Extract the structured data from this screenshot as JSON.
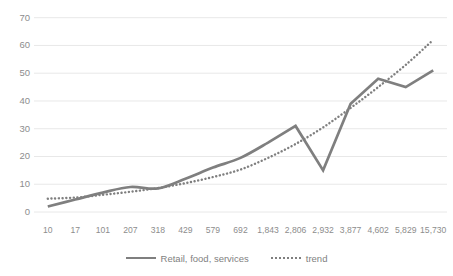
{
  "chart_data": {
    "type": "line",
    "title": "",
    "xlabel": "",
    "ylabel": "",
    "ylim": [
      0,
      70
    ],
    "ytick_step": 10,
    "grid": true,
    "legend_position": "bottom",
    "categories": [
      "10",
      "17",
      "101",
      "207",
      "318",
      "429",
      "579",
      "692",
      "1,843",
      "2,806",
      "2,932",
      "3,877",
      "4,602",
      "5,829",
      "15,730"
    ],
    "ticks": {
      "y": [
        "0",
        "10",
        "20",
        "30",
        "40",
        "50",
        "60",
        "70"
      ]
    },
    "series": [
      {
        "name": "Retail, food, services",
        "style": "solid",
        "color": "#7f7f7f",
        "smooth": true,
        "values": [
          2,
          4.5,
          7,
          9,
          8.5,
          12,
          16,
          19.5,
          25,
          31,
          15,
          39,
          48,
          45,
          51
        ]
      },
      {
        "name": "trend",
        "style": "dotted",
        "color": "#7f7f7f",
        "smooth": false,
        "values": [
          4.8,
          5.2,
          6.2,
          7.3,
          8.6,
          10.4,
          12.6,
          15.3,
          19.5,
          24.5,
          30.5,
          37.5,
          45.0,
          53.0,
          62.0
        ]
      }
    ]
  },
  "legend": {
    "entries": [
      {
        "label": "Retail, food, services",
        "style": "solid"
      },
      {
        "label": "trend",
        "style": "dotted"
      }
    ]
  },
  "colors": {
    "series_line": "#7f7f7f",
    "gridline": "#e8e8e8",
    "tick_text": "#8d8d8d",
    "background": "#ffffff"
  }
}
